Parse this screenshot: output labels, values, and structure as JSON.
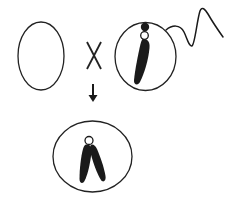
{
  "diagram": {
    "title": "Fertilization: egg cell crossed with sperm cell produces zygote with paired chromosomes",
    "colors": {
      "background": "#ffffff",
      "stroke": "#222222",
      "fill_dark": "#1a1a1a"
    },
    "operator_symbol": "X",
    "elements": {
      "egg_cell": {
        "label": "egg cell (empty)",
        "icon": "ellipse-outline"
      },
      "cross_symbol": {
        "label": "cross / combined with",
        "icon": "x-mark"
      },
      "sperm_cell": {
        "label": "sperm cell with single chromosome and tail",
        "icon": "sperm-icon"
      },
      "arrow": {
        "label": "results in",
        "icon": "arrow-down-icon"
      },
      "zygote": {
        "label": "zygote with paired chromosomes",
        "icon": "cell-with-chromosome-pair"
      }
    }
  }
}
